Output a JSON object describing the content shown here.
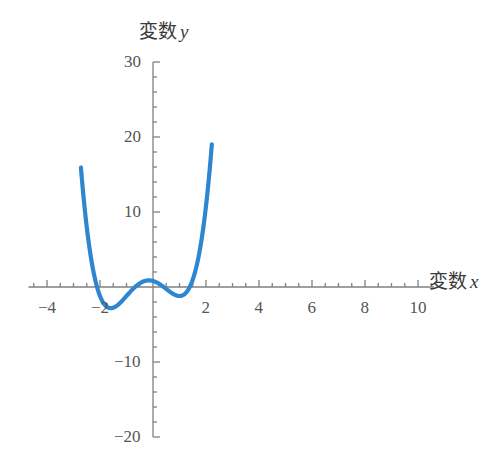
{
  "chart_data": {
    "type": "line",
    "title": "",
    "subtitle": "",
    "xlabel": "変数 x",
    "ylabel": "変数 y",
    "xlabel_cjk": "変数",
    "xlabel_var": "x",
    "ylabel_cjk": "変数",
    "ylabel_var": "y",
    "xlim": [
      -4.7,
      10.6
    ],
    "ylim": [
      -20,
      30
    ],
    "x_major_ticks": [
      -4,
      -2,
      2,
      4,
      6,
      8,
      10
    ],
    "x_tick_labels": [
      "-4",
      "-2",
      "2",
      "4",
      "6",
      "8",
      "10"
    ],
    "y_major_ticks": [
      -20,
      -10,
      10,
      20,
      30
    ],
    "y_tick_labels": [
      "-20",
      "-10",
      "10",
      "20",
      "30"
    ],
    "x_minor_step": 0.5,
    "y_minor_step": 2,
    "grid": false,
    "legend": null,
    "axes_color": "#808080",
    "series": [
      {
        "name": "quartic",
        "color": "#2e86d0",
        "line_width": 4.2,
        "type": "polynomial",
        "coefficients_high_to_low": [
          1,
          1,
          -3,
          -1,
          0.8
        ],
        "equation": "y = x^4 + x^3 - 3x^2 - x + 0.8",
        "x_domain": [
          -2.72,
          2.22
        ],
        "samples": 600,
        "key_points": [
          {
            "label": "left-minimum",
            "x": -1.5,
            "y": -1.2
          },
          {
            "label": "local-maximum",
            "x": -0.22,
            "y": 0.9
          },
          {
            "label": "right-minimum",
            "x": 1.05,
            "y": -1.2
          },
          {
            "label": "left-branch-top",
            "x": -2.72,
            "y": 30
          },
          {
            "label": "right-branch-top",
            "x": 2.22,
            "y": 30
          }
        ]
      }
    ]
  },
  "geometry": {
    "origin_px": {
      "x": 153,
      "y": 287
    },
    "x_scale_px_per_unit": 26.5,
    "y_scale_px_per_unit": 7.5
  }
}
